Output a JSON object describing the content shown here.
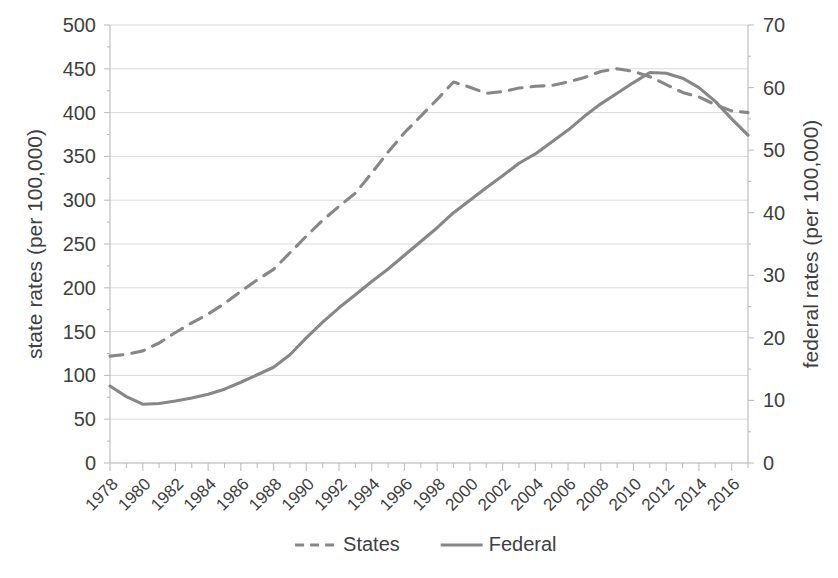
{
  "chart_data": {
    "type": "line",
    "title": "",
    "subtitle": "",
    "xlabel": "",
    "ylabel": "state rates (per 100,000)",
    "y2label": "federal rates (per 100,000)",
    "xlim": [
      1978,
      2017
    ],
    "ylim": [
      0,
      500
    ],
    "y2lim": [
      0,
      70
    ],
    "grid": true,
    "legend_position": "bottom",
    "y_ticks": [
      0,
      50,
      100,
      150,
      200,
      250,
      300,
      350,
      400,
      450,
      500
    ],
    "y_tick_labels": [
      "0",
      "50",
      "100",
      "150",
      "200",
      "250",
      "300",
      "350",
      "400",
      "450",
      "500"
    ],
    "y2_ticks": [
      0,
      10,
      20,
      30,
      40,
      50,
      60,
      70
    ],
    "y2_tick_labels": [
      "0",
      "10",
      "20",
      "30",
      "40",
      "50",
      "60",
      "70"
    ],
    "x_ticks": [
      1978,
      1980,
      1982,
      1984,
      1986,
      1988,
      1990,
      1992,
      1994,
      1996,
      1998,
      2000,
      2002,
      2004,
      2006,
      2008,
      2010,
      2012,
      2014,
      2016
    ],
    "x_tick_labels": [
      "1978",
      "1980",
      "1982",
      "1984",
      "1986",
      "1988",
      "1990",
      "1992",
      "1994",
      "1996",
      "1998",
      "2000",
      "2002",
      "2004",
      "2006",
      "2008",
      "2010",
      "2012",
      "2014",
      "2016"
    ],
    "x": [
      1978,
      1979,
      1980,
      1981,
      1982,
      1983,
      1984,
      1985,
      1986,
      1987,
      1988,
      1989,
      1990,
      1991,
      1992,
      1993,
      1994,
      1995,
      1996,
      1997,
      1998,
      1999,
      2000,
      2001,
      2002,
      2003,
      2004,
      2005,
      2006,
      2007,
      2008,
      2009,
      2010,
      2011,
      2012,
      2013,
      2014,
      2015,
      2016,
      2017
    ],
    "series": [
      {
        "name": "States",
        "axis": "left",
        "style": "dashed",
        "color": "#878787",
        "values": [
          122,
          124,
          128,
          137,
          149,
          160,
          170,
          182,
          196,
          209,
          221,
          240,
          259,
          277,
          293,
          308,
          331,
          355,
          377,
          396,
          415,
          435,
          429,
          422,
          424,
          428,
          430,
          431,
          435,
          440,
          447,
          450,
          447,
          441,
          432,
          423,
          418,
          409,
          402,
          400
        ]
      },
      {
        "name": "Federal",
        "axis": "right",
        "style": "solid",
        "color": "#878787",
        "values": [
          12.3,
          10.6,
          9.4,
          9.5,
          9.9,
          10.4,
          11.0,
          11.8,
          12.9,
          14.1,
          15.3,
          17.3,
          20.0,
          22.5,
          24.8,
          26.9,
          29.0,
          31.0,
          33.2,
          35.4,
          37.6,
          40.0,
          42.0,
          44.0,
          45.9,
          47.9,
          49.4,
          51.3,
          53.2,
          55.4,
          57.4,
          59.1,
          60.8,
          62.4,
          62.3,
          61.5,
          60.0,
          57.8,
          55.0,
          52.4
        ]
      }
    ],
    "legend": [
      {
        "label": "States",
        "style": "dashed",
        "color": "#878787"
      },
      {
        "label": "Federal",
        "style": "solid",
        "color": "#878787"
      }
    ],
    "colors": {
      "series": "#878787",
      "grid": "#d9d9d9",
      "axis": "#bfbfbf",
      "text": "#404040",
      "background": "#ffffff"
    }
  }
}
